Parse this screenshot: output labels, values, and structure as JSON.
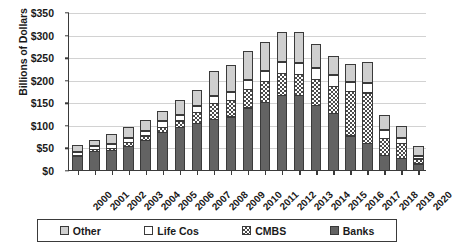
{
  "chart_data": {
    "type": "bar",
    "subtype": "stacked-bar",
    "title": "",
    "xlabel": "",
    "ylabel": "Billions of Dollars",
    "ylim": [
      0,
      350
    ],
    "ytick_values": [
      0,
      50,
      100,
      150,
      200,
      250,
      300,
      350
    ],
    "ytick_labels": [
      "$0",
      "$50",
      "$100",
      "$150",
      "$200",
      "$250",
      "$300",
      "$350"
    ],
    "grid": true,
    "legend_position": "bottom",
    "categories": [
      "2000",
      "2001",
      "2002",
      "2003",
      "2004",
      "2005",
      "2006",
      "2007",
      "2008",
      "2009",
      "2010",
      "2011",
      "2012",
      "2013",
      "2014",
      "2015",
      "2016",
      "2017",
      "2018",
      "2019",
      "2020"
    ],
    "series": [
      {
        "name": "Banks",
        "color": "#636363",
        "pattern": "solid",
        "values": [
          33,
          43,
          45,
          55,
          68,
          85,
          97,
          105,
          115,
          120,
          140,
          152,
          168,
          168,
          145,
          128,
          78,
          62,
          35,
          28,
          16
        ]
      },
      {
        "name": "CMBS",
        "color": "#ffffff",
        "pattern": "checkered",
        "values": [
          4,
          6,
          7,
          10,
          12,
          14,
          16,
          26,
          37,
          38,
          43,
          48,
          50,
          48,
          60,
          62,
          100,
          113,
          40,
          36,
          13
        ]
      },
      {
        "name": "Life Cos",
        "color": "#ffffff",
        "pattern": "solid",
        "values": [
          7,
          9,
          10,
          11,
          12,
          14,
          15,
          16,
          18,
          20,
          22,
          24,
          26,
          26,
          26,
          26,
          22,
          24,
          18,
          13,
          8
        ]
      },
      {
        "name": "Other",
        "color": "#cfcfcf",
        "pattern": "solid",
        "values": [
          16,
          14,
          23,
          25,
          25,
          24,
          32,
          36,
          55,
          60,
          63,
          64,
          66,
          68,
          53,
          42,
          41,
          46,
          35,
          26,
          21
        ]
      }
    ],
    "totals": [
      60,
      72,
      85,
      101,
      117,
      137,
      160,
      183,
      225,
      238,
      268,
      288,
      310,
      310,
      284,
      258,
      241,
      245,
      128,
      103,
      58
    ],
    "legend_entries": [
      {
        "label": "Other",
        "swatch": "light-gray-solid"
      },
      {
        "label": "Life Cos",
        "swatch": "white-solid"
      },
      {
        "label": "CMBS",
        "swatch": "checkered"
      },
      {
        "label": "Banks",
        "swatch": "dark-gray-solid"
      }
    ]
  }
}
